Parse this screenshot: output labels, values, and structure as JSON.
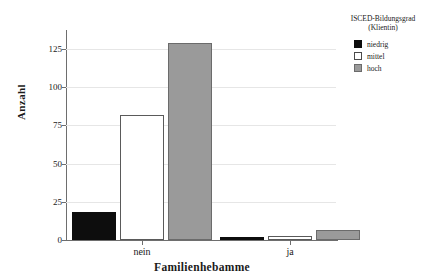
{
  "chart_data": {
    "type": "bar",
    "title": "",
    "xlabel": "Familienhebamme",
    "ylabel": "Anzahl",
    "categories": [
      "nein",
      "ja"
    ],
    "series": [
      {
        "name": "niedrig",
        "values": [
          19,
          2
        ],
        "color": "#0d0d0d"
      },
      {
        "name": "mittel",
        "values": [
          86,
          3
        ],
        "color": "#ffffff"
      },
      {
        "name": "hoch",
        "values": [
          136,
          7
        ],
        "color": "#9a9a9a"
      }
    ],
    "ylim": [
      0,
      145
    ],
    "yticks": [
      0,
      25,
      50,
      75,
      100,
      125
    ],
    "ytick_labels": [
      "0",
      "25",
      "50",
      "75",
      "100",
      "125"
    ],
    "grid": true,
    "legend": {
      "title_line1": "ISCED-Bildungsgrad",
      "title_line2": "(Klientin)",
      "position": "right-top",
      "entries": [
        "niedrig",
        "mittel",
        "hoch"
      ]
    }
  },
  "axes": {
    "y_label": "Anzahl",
    "x_label": "Familienhebamme",
    "y_ticks": [
      {
        "value": 125,
        "label": "125"
      },
      {
        "value": 100,
        "label": "100"
      },
      {
        "value": 75,
        "label": "75"
      },
      {
        "value": 50,
        "label": "50"
      },
      {
        "value": 25,
        "label": "25"
      },
      {
        "value": 0,
        "label": "0"
      }
    ],
    "x_ticks": [
      {
        "label": "nein"
      },
      {
        "label": "ja"
      }
    ]
  },
  "legend": {
    "title_line1": "ISCED-Bildungsgrad",
    "title_line2": "(Klientin)",
    "items": [
      {
        "label": "niedrig"
      },
      {
        "label": "mittel"
      },
      {
        "label": "hoch"
      }
    ]
  }
}
